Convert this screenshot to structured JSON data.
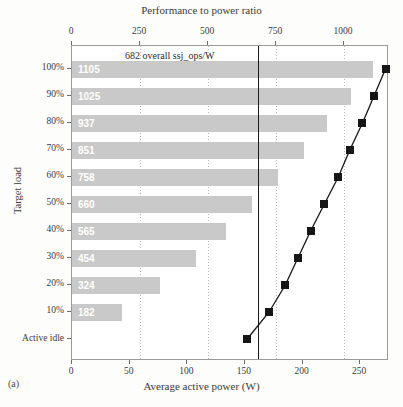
{
  "chart_data": {
    "type": "bar",
    "title": "",
    "panel_label": "(a)",
    "top_axis": {
      "label": "Performance to power ratio",
      "ticks": [
        0,
        250,
        500,
        750,
        1000
      ],
      "range": [
        0,
        1165
      ]
    },
    "bottom_axis": {
      "label": "Average active power (W)",
      "ticks": [
        0,
        50,
        100,
        150,
        200,
        250
      ],
      "range": [
        0,
        275
      ]
    },
    "ylabel": "Target load",
    "categories": [
      "100%",
      "90%",
      "80%",
      "70%",
      "60%",
      "50%",
      "40%",
      "30%",
      "20%",
      "10%",
      "Active idle"
    ],
    "series": [
      {
        "name": "Performance to power ratio (ssj_ops/W)",
        "type": "bar",
        "values": [
          1105,
          1025,
          937,
          851,
          758,
          660,
          565,
          454,
          324,
          182,
          null
        ],
        "color": "#c9c9c9",
        "label_color": "#ffffff"
      },
      {
        "name": "Average active power (W)",
        "type": "line-scatter",
        "values": [
          272,
          262,
          252,
          241,
          231,
          219,
          207,
          196,
          185,
          171,
          152
        ],
        "color": "#161616",
        "marker": "square"
      }
    ],
    "reference_line": {
      "value": 682,
      "axis": "top",
      "annotation": "682 overall ssj_ops/W",
      "color": "#1a1a1a"
    },
    "grid": "vertical-dotted",
    "legend": "none"
  }
}
